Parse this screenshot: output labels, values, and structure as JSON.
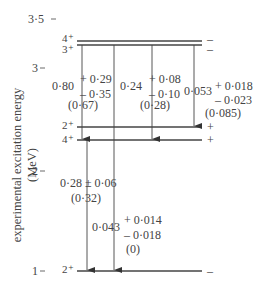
{
  "axis": {
    "ylabel": "experimental excitation energy (MeV)",
    "ticks": [
      "3·5",
      "3",
      "2",
      "1"
    ]
  },
  "levels": [
    {
      "spin": "4⁺",
      "parity_right": "–"
    },
    {
      "spin": "3⁺",
      "parity_right": "–"
    },
    {
      "spin": "2⁺",
      "parity_right": "+"
    },
    {
      "spin": "4⁺",
      "parity_right": "+"
    },
    {
      "spin": "2⁺",
      "parity_right": "–"
    }
  ],
  "transitions": [
    {
      "value": "0·80",
      "plus": "+ 0·29",
      "minus": "– 0·35",
      "theory": "(0·67)"
    },
    {
      "value": "0·24",
      "plus": "+ 0·08",
      "minus": "– 0·10",
      "theory": "(0·28)"
    },
    {
      "value": "0·053",
      "plus": "+ 0·018",
      "minus": "– 0·023",
      "theory": "(0·085)"
    },
    {
      "value": "0·28 ± 0·06",
      "theory": "(0·32)"
    },
    {
      "value": "0·043",
      "plus": "+ 0·014",
      "minus": "– 0·018",
      "theory": "(0)"
    }
  ]
}
